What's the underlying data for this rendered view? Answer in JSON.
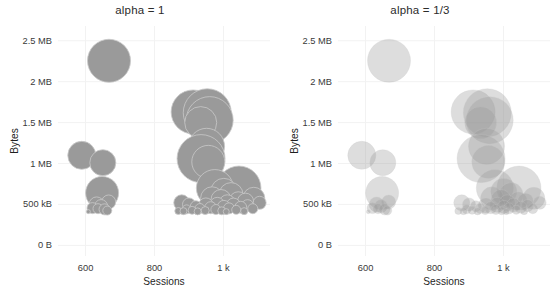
{
  "figure": {
    "width": 560,
    "height": 302,
    "background": "#ffffff",
    "grid_color": "#f2f2f2",
    "bubble_fill": "#9a9a9a",
    "bubble_stroke": "#c9c9c9"
  },
  "axes": {
    "x_title": "Sessions",
    "y_title": "Bytes",
    "x_ticks": [
      {
        "label": "600",
        "value": 600
      },
      {
        "label": "800",
        "value": 800
      },
      {
        "label": "1 k",
        "value": 1000
      }
    ],
    "y_ticks": [
      {
        "label": "0 B",
        "value": 0
      },
      {
        "label": "500 kB",
        "value": 500000
      },
      {
        "label": "1 MB",
        "value": 1000000
      },
      {
        "label": "1.5 MB",
        "value": 1500000
      },
      {
        "label": "2 MB",
        "value": 2000000
      },
      {
        "label": "2.5 MB",
        "value": 2500000
      }
    ],
    "xlim": [
      520,
      1135
    ],
    "ylim": [
      -130000,
      2680000
    ]
  },
  "chart_data": {
    "type": "scatter",
    "title": "",
    "xlabel": "Sessions",
    "ylabel": "Bytes",
    "xlim": [
      520,
      1135
    ],
    "ylim": [
      -130000,
      2680000
    ],
    "grid": true,
    "legend": "none",
    "panels": [
      {
        "id": "left",
        "title": "alpha = 1",
        "alpha": 1.0
      },
      {
        "id": "right",
        "title": "alpha = 1/3",
        "alpha": 0.3333
      }
    ],
    "note": "Same bubble data drawn twice; left panel fully opaque, right panel at one-third opacity so overlaps accumulate.",
    "size_encoding": "bubble radius encodes a third magnitude variable",
    "points": [
      {
        "x": 668,
        "y": 2255000,
        "r": 21.5
      },
      {
        "x": 589,
        "y": 1100000,
        "r": 14.0
      },
      {
        "x": 650,
        "y": 1010000,
        "r": 13.0
      },
      {
        "x": 648,
        "y": 640000,
        "r": 16.5
      },
      {
        "x": 667,
        "y": 530000,
        "r": 7.0
      },
      {
        "x": 632,
        "y": 500000,
        "r": 7.5
      },
      {
        "x": 645,
        "y": 480000,
        "r": 6.5
      },
      {
        "x": 620,
        "y": 455000,
        "r": 5.5
      },
      {
        "x": 636,
        "y": 448000,
        "r": 5.0
      },
      {
        "x": 655,
        "y": 440000,
        "r": 5.5
      },
      {
        "x": 663,
        "y": 425000,
        "r": 4.5
      },
      {
        "x": 608,
        "y": 412000,
        "r": 2.0
      },
      {
        "x": 912,
        "y": 1630000,
        "r": 22.0
      },
      {
        "x": 953,
        "y": 1620000,
        "r": 24.0
      },
      {
        "x": 960,
        "y": 1530000,
        "r": 23.5
      },
      {
        "x": 934,
        "y": 1500000,
        "r": 16.0
      },
      {
        "x": 951,
        "y": 1210000,
        "r": 18.0
      },
      {
        "x": 935,
        "y": 1060000,
        "r": 24.0
      },
      {
        "x": 956,
        "y": 1020000,
        "r": 16.5
      },
      {
        "x": 1045,
        "y": 700000,
        "r": 22.0
      },
      {
        "x": 975,
        "y": 700000,
        "r": 18.5
      },
      {
        "x": 1001,
        "y": 660000,
        "r": 13.0
      },
      {
        "x": 1022,
        "y": 620000,
        "r": 12.0
      },
      {
        "x": 1088,
        "y": 575000,
        "r": 11.0
      },
      {
        "x": 967,
        "y": 575000,
        "r": 11.5
      },
      {
        "x": 993,
        "y": 560000,
        "r": 10.0
      },
      {
        "x": 1043,
        "y": 545000,
        "r": 9.0
      },
      {
        "x": 1064,
        "y": 540000,
        "r": 8.0
      },
      {
        "x": 1105,
        "y": 520000,
        "r": 6.5
      },
      {
        "x": 1011,
        "y": 520000,
        "r": 8.0
      },
      {
        "x": 879,
        "y": 520000,
        "r": 8.0
      },
      {
        "x": 900,
        "y": 500000,
        "r": 6.5
      },
      {
        "x": 982,
        "y": 495000,
        "r": 7.5
      },
      {
        "x": 1029,
        "y": 492000,
        "r": 7.0
      },
      {
        "x": 949,
        "y": 488000,
        "r": 7.5
      },
      {
        "x": 1070,
        "y": 485000,
        "r": 6.0
      },
      {
        "x": 920,
        "y": 478000,
        "r": 5.5
      },
      {
        "x": 1001,
        "y": 470000,
        "r": 6.5
      },
      {
        "x": 1050,
        "y": 465000,
        "r": 6.0
      },
      {
        "x": 963,
        "y": 460000,
        "r": 6.0
      },
      {
        "x": 1016,
        "y": 452000,
        "r": 5.5
      },
      {
        "x": 932,
        "y": 450000,
        "r": 5.0
      },
      {
        "x": 1085,
        "y": 448000,
        "r": 5.0
      },
      {
        "x": 893,
        "y": 440000,
        "r": 4.5
      },
      {
        "x": 978,
        "y": 438000,
        "r": 5.0
      },
      {
        "x": 1037,
        "y": 434000,
        "r": 4.5
      },
      {
        "x": 909,
        "y": 428000,
        "r": 4.0
      },
      {
        "x": 947,
        "y": 425000,
        "r": 4.0
      },
      {
        "x": 995,
        "y": 422000,
        "r": 4.0
      },
      {
        "x": 869,
        "y": 420000,
        "r": 3.5
      },
      {
        "x": 884,
        "y": 418000,
        "r": 3.5
      },
      {
        "x": 1060,
        "y": 418000,
        "r": 3.5
      },
      {
        "x": 925,
        "y": 415000,
        "r": 3.5
      },
      {
        "x": 1008,
        "y": 412000,
        "r": 3.0
      }
    ]
  }
}
